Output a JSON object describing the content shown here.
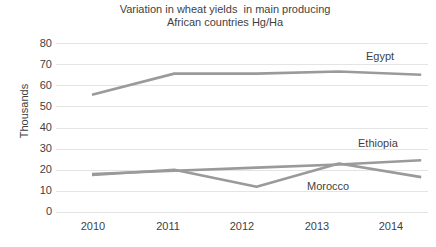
{
  "chart_data": {
    "type": "line",
    "title_line1": "Variation in wheat yields  in main producing",
    "title_line2": "African countries Hg/Ha",
    "xlabel": "",
    "ylabel": "Thousands",
    "categories": [
      "2010",
      "2011",
      "2012",
      "2013",
      "2014"
    ],
    "x": [
      2010,
      2011,
      2012,
      2013,
      2014
    ],
    "ylim": [
      0,
      80
    ],
    "ytick_step": 10,
    "yticks": [
      "80",
      "70",
      "60",
      "50",
      "40",
      "30",
      "20",
      "10",
      "0"
    ],
    "grid": "horizontal",
    "legend_position": "inline-right-labels",
    "series": [
      {
        "name": "Egypt",
        "values": [
          55.5,
          65.5,
          65.5,
          66.5,
          65.0
        ],
        "color": "#9a9a9a",
        "label": "Egypt"
      },
      {
        "name": "Ethiopia",
        "values": [
          18.0,
          19.5,
          21.0,
          22.5,
          24.5
        ],
        "color": "#9a9a9a",
        "label": "Ethiopia"
      },
      {
        "name": "Morocco",
        "values": [
          17.5,
          20.0,
          12.0,
          23.0,
          16.5
        ],
        "color": "#9a9a9a",
        "label": "Morocco"
      }
    ],
    "annotations": [
      {
        "text": "Egypt",
        "x": 2014,
        "y": 76.5
      },
      {
        "text": "Ethiopia",
        "x": 2014,
        "y": 33.5
      },
      {
        "text": "Morocco",
        "x": 2013,
        "y": 12.5
      }
    ],
    "colors": {
      "background": "#ffffff",
      "gridline": "#e4e4e4",
      "line": "#9a9a9a",
      "text": "#3f3f3f"
    }
  }
}
